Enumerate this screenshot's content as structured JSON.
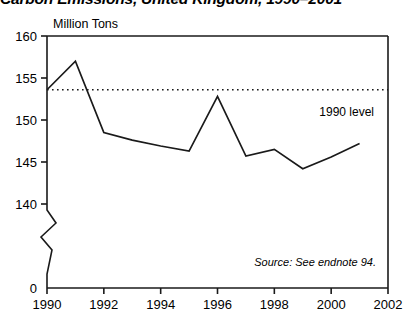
{
  "chart_data": {
    "type": "line",
    "title": "Carbon Emissions, United Kingdom, 1990–2001",
    "ylabel": "Million Tons",
    "xlabel": "",
    "x": [
      1990,
      1991,
      1992,
      1993,
      1994,
      1995,
      1996,
      1997,
      1998,
      1999,
      2000,
      2001
    ],
    "values": [
      153.6,
      157.0,
      148.5,
      147.6,
      146.9,
      146.3,
      152.8,
      145.7,
      146.5,
      144.2,
      145.6,
      147.2
    ],
    "series": [
      {
        "name": "Carbon Emissions",
        "values": [
          153.6,
          157.0,
          148.5,
          147.6,
          146.9,
          146.3,
          152.8,
          145.7,
          146.5,
          144.2,
          145.6,
          147.2
        ]
      }
    ],
    "xlim": [
      1990,
      2002
    ],
    "ylim": [
      140,
      160
    ],
    "y_axis_break": true,
    "y_break_value": 0,
    "ytick_labels": [
      "160",
      "155",
      "150",
      "145",
      "140",
      "0"
    ],
    "ytick_values": [
      160,
      155,
      150,
      145,
      140,
      0
    ],
    "xtick_labels": [
      "1990",
      "1992",
      "1994",
      "1996",
      "1998",
      "2000",
      "2002"
    ],
    "xtick_values": [
      1990,
      1992,
      1994,
      1996,
      1998,
      2000,
      2002
    ],
    "grid": false,
    "legend": "none",
    "annotations": [
      {
        "name": "1990-level-reference",
        "label": "1990 level",
        "value": 153.6,
        "style": "dotted-horizontal-line"
      }
    ],
    "source_note": "Source: See endnote 94."
  },
  "colors": {
    "line": "#1a1a1a",
    "axis": "#1a1a1a",
    "reference_line": "#1a1a1a",
    "background": "#ffffff",
    "text": "#000000"
  }
}
